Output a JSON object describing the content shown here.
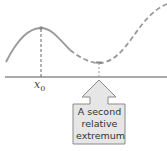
{
  "diagram": {
    "x_label": "x",
    "x_label_subscript": "0",
    "callout_lines": [
      "A second",
      "relative",
      "extremum"
    ],
    "colors": {
      "curve": "#9a9a9a",
      "axis": "#555555",
      "box_fill": "#e6e6e6",
      "box_stroke": "#8a8a8a",
      "text": "#333333"
    }
  }
}
